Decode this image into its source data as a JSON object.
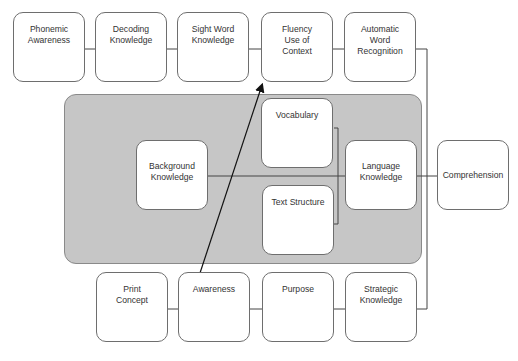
{
  "diagram": {
    "top_row": [
      {
        "label": "Phonemic\nAwareness"
      },
      {
        "label": "Decoding\nKnowledge"
      },
      {
        "label": "Sight Word\nKnowledge"
      },
      {
        "label": "Fluency\nUse of\nContext"
      },
      {
        "label": "Automatic\nWord\nRecognition"
      }
    ],
    "center_group": {
      "background": {
        "label": "Background\nKnowledge"
      },
      "vocabulary": {
        "label": "Vocabulary"
      },
      "text_structure": {
        "label": "Text Structure"
      },
      "language": {
        "label": "Language\nKnowledge"
      }
    },
    "outcome": {
      "label": "Comprehension"
    },
    "bottom_row": [
      {
        "label": "Print\nConcept"
      },
      {
        "label": "Awareness"
      },
      {
        "label": "Purpose"
      },
      {
        "label": "Strategic\nKnowledge"
      }
    ],
    "colors": {
      "container_fill": "#c6c6c6",
      "node_border": "#6e6e6e",
      "line": "#333333"
    }
  }
}
